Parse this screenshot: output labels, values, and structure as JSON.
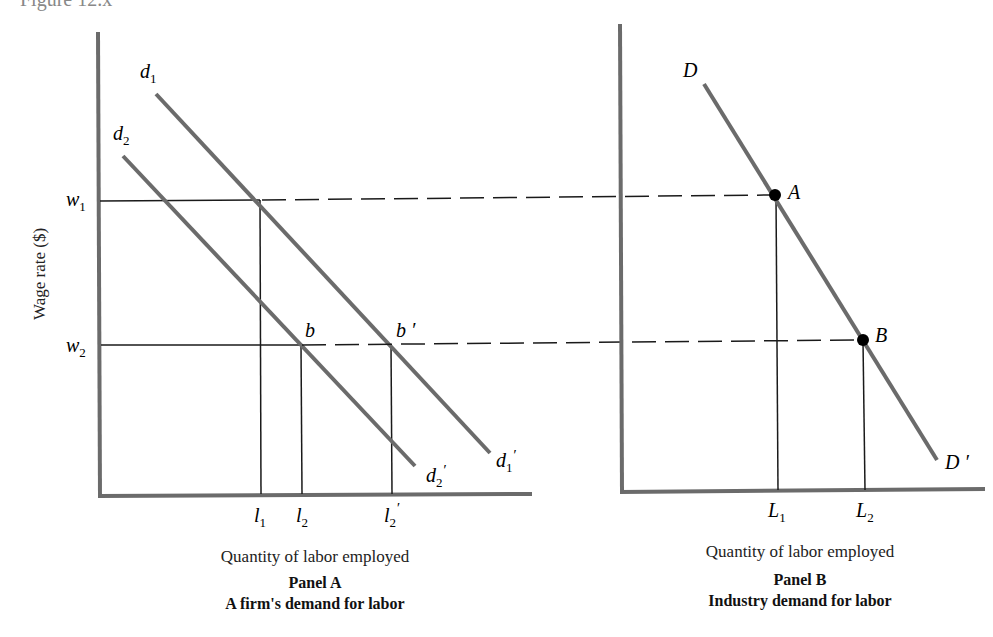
{
  "figure": {
    "caption_fragment": "Figure 12.x"
  },
  "panel_a": {
    "ylabel": "Wage rate ($)",
    "xlabel": "Quantity of labor employed",
    "title": "Panel A",
    "subtitle": "A firm's demand for labor",
    "y_ticks": [
      {
        "base": "w",
        "sub": "1"
      },
      {
        "base": "w",
        "sub": "2"
      }
    ],
    "x_ticks": [
      {
        "base": "l",
        "sub": "1",
        "prime": ""
      },
      {
        "base": "l",
        "sub": "2",
        "prime": ""
      },
      {
        "base": "l",
        "sub": "2",
        "prime": "′"
      }
    ],
    "curves": [
      {
        "start": {
          "base": "d",
          "sub": "1",
          "prime": ""
        },
        "end": {
          "base": "d",
          "sub": "1",
          "prime": "′"
        }
      },
      {
        "start": {
          "base": "d",
          "sub": "2",
          "prime": ""
        },
        "end": {
          "base": "d",
          "sub": "2",
          "prime": "′"
        }
      }
    ],
    "points": [
      {
        "label": "b"
      },
      {
        "label": "b ′"
      }
    ]
  },
  "panel_b": {
    "xlabel": "Quantity of labor employed",
    "title": "Panel B",
    "subtitle": "Industry demand for labor",
    "x_ticks": [
      {
        "base": "L",
        "sub": "1"
      },
      {
        "base": "L",
        "sub": "2"
      }
    ],
    "curve": {
      "start": "D",
      "end": "D ′"
    },
    "points": [
      {
        "label": "A"
      },
      {
        "label": "B"
      }
    ]
  },
  "colors": {
    "curve": "#6b6b6b",
    "axis": "#6b6b6b",
    "guide": "#1a1a1a",
    "point": "#000000"
  }
}
